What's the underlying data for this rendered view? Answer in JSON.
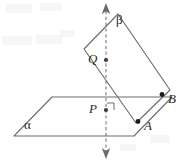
{
  "figure": {
    "width": 182,
    "height": 162,
    "background_color": "#ffffff",
    "stroke_color": "#6b6b6b",
    "label_color": "#2b2b2b",
    "dot_color": "#1c1c1c"
  },
  "labels": {
    "alpha": "α",
    "beta": "β",
    "point_p": "P",
    "point_q": "Q",
    "point_a": "A",
    "point_b": "B"
  },
  "label_positions": {
    "alpha": {
      "x": 24,
      "y": 120
    },
    "beta": {
      "x": 116,
      "y": 15
    },
    "point_p": {
      "x": 89,
      "y": 103
    },
    "point_q": {
      "x": 89,
      "y": 53
    },
    "point_a": {
      "x": 144,
      "y": 121
    },
    "point_b": {
      "x": 168,
      "y": 94
    }
  },
  "geometry": {
    "plane_alpha": {
      "name": "plane-alpha",
      "shape": "parallelogram",
      "points": "14,136 52,97 172,97 134,136"
    },
    "plane_beta": {
      "name": "plane-beta",
      "shape": "parallelogram",
      "points": "118,14 170,90 136,123 84,49"
    },
    "vertical_line": {
      "name": "perpendicular-line",
      "style": "dashed-with-double-arrow",
      "x": 106,
      "y_top": 11,
      "y_bottom": 152
    },
    "arrow_top": {
      "x": 106,
      "y": 4
    },
    "arrow_bottom": {
      "x": 106,
      "y": 158
    },
    "points": [
      {
        "id": "P",
        "x": 106,
        "y": 110,
        "marker": "dot"
      },
      {
        "id": "Q",
        "x": 106,
        "y": 60,
        "marker": "dot"
      },
      {
        "id": "A",
        "x": 138,
        "y": 122,
        "marker": "dot"
      },
      {
        "id": "B",
        "x": 162,
        "y": 95,
        "marker": "dot"
      }
    ],
    "right_angle_marker": {
      "name": "right-angle-marker",
      "at": "P",
      "points": "107,103 114,103 114,110"
    }
  }
}
